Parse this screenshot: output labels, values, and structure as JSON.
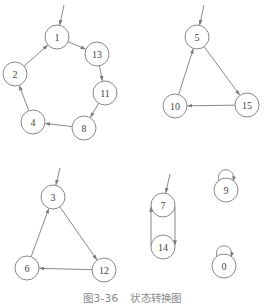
{
  "caption": {
    "figure_number": "图3-36",
    "title": "状态转换图"
  },
  "diagram": {
    "type": "state-transition-graph",
    "node_radius": 12,
    "colors": {
      "stroke": "#7a7a7a",
      "text": "#444444",
      "caption": "#8a8a8a"
    },
    "nodes": [
      {
        "id": "1",
        "label": "1",
        "x": 57,
        "y": 37
      },
      {
        "id": "13",
        "label": "13",
        "x": 97,
        "y": 54
      },
      {
        "id": "11",
        "label": "11",
        "x": 105,
        "y": 93
      },
      {
        "id": "8",
        "label": "8",
        "x": 84,
        "y": 128
      },
      {
        "id": "4",
        "label": "4",
        "x": 33,
        "y": 122
      },
      {
        "id": "2",
        "label": "2",
        "x": 15,
        "y": 74
      },
      {
        "id": "5",
        "label": "5",
        "x": 197,
        "y": 37
      },
      {
        "id": "15",
        "label": "15",
        "x": 247,
        "y": 105
      },
      {
        "id": "10",
        "label": "10",
        "x": 175,
        "y": 106
      },
      {
        "id": "3",
        "label": "3",
        "x": 53,
        "y": 197
      },
      {
        "id": "12",
        "label": "12",
        "x": 104,
        "y": 270
      },
      {
        "id": "6",
        "label": "6",
        "x": 27,
        "y": 268
      },
      {
        "id": "7",
        "label": "7",
        "x": 163,
        "y": 205
      },
      {
        "id": "14",
        "label": "14",
        "x": 163,
        "y": 247
      },
      {
        "id": "9",
        "label": "9",
        "x": 226,
        "y": 190
      },
      {
        "id": "0",
        "label": "0",
        "x": 224,
        "y": 266
      }
    ],
    "start_arrows": [
      {
        "to": "1",
        "from_x": 64,
        "from_y": 5
      },
      {
        "to": "5",
        "from_x": 204,
        "from_y": 5
      },
      {
        "to": "3",
        "from_x": 60,
        "from_y": 168
      },
      {
        "to": "7",
        "from_x": 170,
        "from_y": 174
      }
    ],
    "edges": [
      {
        "from": "1",
        "to": "13"
      },
      {
        "from": "13",
        "to": "11"
      },
      {
        "from": "11",
        "to": "8"
      },
      {
        "from": "8",
        "to": "4"
      },
      {
        "from": "4",
        "to": "2"
      },
      {
        "from": "2",
        "to": "1"
      },
      {
        "from": "5",
        "to": "15"
      },
      {
        "from": "15",
        "to": "10"
      },
      {
        "from": "10",
        "to": "5"
      },
      {
        "from": "3",
        "to": "12"
      },
      {
        "from": "12",
        "to": "6"
      },
      {
        "from": "6",
        "to": "3"
      },
      {
        "from": "7",
        "to": "14",
        "side": "right"
      },
      {
        "from": "14",
        "to": "7",
        "side": "left"
      }
    ],
    "self_loops": [
      "9",
      "0"
    ]
  }
}
